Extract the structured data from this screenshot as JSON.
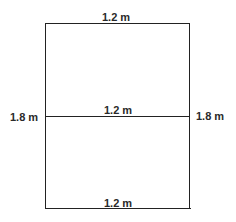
{
  "diagram": {
    "labels": {
      "top_width": "1.2 m",
      "middle_width": "1.2 m",
      "bottom_width": "1.2 m",
      "left_height": "1.8 m",
      "right_height": "1.8 m"
    },
    "line_color": "#222222"
  }
}
